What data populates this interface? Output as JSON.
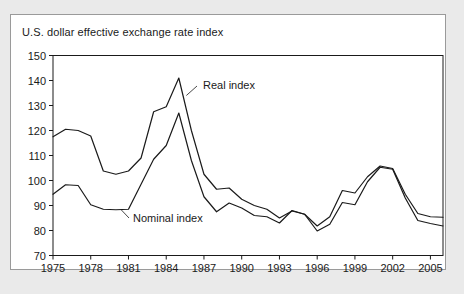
{
  "figure": {
    "title": "U.S. dollar effective exchange rate index",
    "background_color": "#eaeaea",
    "panel_color": "#ffffff",
    "border_color": "#9a9a9a",
    "line_color": "#1a1a1a"
  },
  "chart_data": {
    "type": "line",
    "title": "U.S. dollar effective exchange rate index",
    "xlabel": "",
    "ylabel": "",
    "xlim": [
      1975,
      2006
    ],
    "ylim": [
      70,
      150
    ],
    "grid": false,
    "legend": "annotations-on-curve",
    "y_ticks": [
      70,
      80,
      90,
      100,
      110,
      120,
      130,
      140,
      150
    ],
    "x_ticks": [
      1975,
      1978,
      1981,
      1984,
      1987,
      1990,
      1993,
      1996,
      1999,
      2002,
      2005
    ],
    "x_tick_labels": [
      "1975",
      "1978",
      "1981",
      "1984",
      "1987",
      "1990",
      "1993",
      "1996",
      "1999",
      "2002",
      "2005"
    ],
    "y_tick_labels": [
      "70",
      "80",
      "90",
      "100",
      "110",
      "120",
      "130",
      "140",
      "150"
    ],
    "x": [
      1975,
      1976,
      1977,
      1978,
      1979,
      1980,
      1981,
      1982,
      1983,
      1984,
      1985,
      1986,
      1987,
      1988,
      1989,
      1990,
      1991,
      1992,
      1993,
      1994,
      1995,
      1996,
      1997,
      1998,
      1999,
      2000,
      2001,
      2002,
      2003,
      2004,
      2005,
      2006
    ],
    "series": [
      {
        "name": "Real index",
        "label": "Real index",
        "color": "#1a1a1a",
        "values": [
          117.5,
          120.5,
          120.0,
          117.8,
          103.8,
          102.5,
          103.8,
          109.0,
          127.5,
          129.5,
          141.0,
          120.0,
          102.5,
          96.5,
          97.0,
          92.5,
          90.0,
          88.5,
          85.0,
          87.8,
          86.5,
          81.8,
          85.5,
          96.0,
          95.0,
          101.5,
          105.8,
          104.8,
          94.5,
          86.8,
          85.5,
          85.3
        ]
      },
      {
        "name": "Nominal index",
        "label": "Nominal index",
        "color": "#1a1a1a",
        "values": [
          94.5,
          98.3,
          98.0,
          90.3,
          88.5,
          88.3,
          88.5,
          98.5,
          108.5,
          114.0,
          127.0,
          108.0,
          93.5,
          87.5,
          91.0,
          89.0,
          86.0,
          85.5,
          83.0,
          88.0,
          86.5,
          79.8,
          82.5,
          91.2,
          90.3,
          99.5,
          105.3,
          104.5,
          93.0,
          84.0,
          82.8,
          81.8
        ]
      }
    ],
    "annotations": [
      {
        "text": "Real index",
        "points_to_series": "Real index",
        "points_to_x": 1985.6,
        "points_to_y": 134.0
      },
      {
        "text": "Nominal index",
        "points_to_series": "Nominal index",
        "points_to_x": 1980.4,
        "points_to_y": 88.4
      }
    ]
  }
}
